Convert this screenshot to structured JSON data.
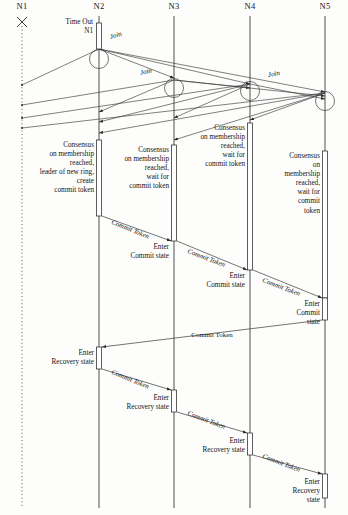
{
  "diagram": {
    "type": "uml-sequence-diagram",
    "width": 348,
    "height": 515,
    "background": "#fdfdfc",
    "line_color": "#333333",
    "text_color": "#141414"
  },
  "nodes": [
    {
      "id": "N1",
      "label": "N1",
      "x": 22,
      "crashed": true,
      "lifeline_style": "dotted"
    },
    {
      "id": "N2",
      "label": "N2",
      "x": 99,
      "crashed": false,
      "lifeline_style": "solid"
    },
    {
      "id": "N3",
      "label": "N3",
      "x": 174,
      "crashed": false,
      "lifeline_style": "solid"
    },
    {
      "id": "N4",
      "label": "N4",
      "x": 250,
      "crashed": false,
      "lifeline_style": "solid"
    },
    {
      "id": "N5",
      "label": "N5",
      "x": 325,
      "crashed": false,
      "lifeline_style": "solid"
    }
  ],
  "timeout": {
    "label": "Time Out\nN1",
    "on_node": "N2",
    "x": 93,
    "y": 18
  },
  "join_labels": [
    {
      "text": "Join",
      "x": 110,
      "y": 33,
      "rotate": -16
    },
    {
      "text": "Join",
      "x": 140,
      "y": 69,
      "rotate": -12
    },
    {
      "text": "Join",
      "x": 268,
      "y": 71,
      "rotate": -10
    }
  ],
  "consensus_blocks": [
    {
      "node": "N2",
      "align": "right",
      "x": 94,
      "y": 141,
      "text": "Consensus\non membership\nreached,\nleader of new ring,\ncreate\ncommit token"
    },
    {
      "node": "N3",
      "align": "right",
      "x": 169,
      "y": 146,
      "text": "Consensus\non membership\nreached,\nwait for\ncommit token"
    },
    {
      "node": "N4",
      "align": "right",
      "x": 245,
      "y": 124,
      "text": "Consensus\non membership\nreached,\nwait for\ncommit token"
    },
    {
      "node": "N5",
      "align": "right",
      "x": 320,
      "y": 152,
      "text": "Consensus\non membership\nreached,\nwait for\ncommit token"
    }
  ],
  "commit_state_labels": [
    {
      "node": "N3",
      "x": 169,
      "y": 243,
      "text": "Enter\nCommit state"
    },
    {
      "node": "N4",
      "x": 245,
      "y": 272,
      "text": "Enter\nCommit state"
    },
    {
      "node": "N5",
      "x": 320,
      "y": 300,
      "text": "Enter\nCommit state"
    }
  ],
  "recovery_state_labels": [
    {
      "node": "N2",
      "x": 94,
      "y": 349,
      "text": "Enter\nRecovery state"
    },
    {
      "node": "N3",
      "x": 169,
      "y": 394,
      "text": "Enter\nRecovery state"
    },
    {
      "node": "N4",
      "x": 245,
      "y": 437,
      "text": "Enter\nRecovery state"
    },
    {
      "node": "N5",
      "x": 320,
      "y": 478,
      "text": "Enter\nRecovery state"
    }
  ],
  "commit_token_messages": [
    {
      "from": "N2",
      "to": "N3",
      "label": "Commit Token",
      "x": 112,
      "y": 218,
      "rotate": 22,
      "italic": true
    },
    {
      "from": "N3",
      "to": "N4",
      "label": "Commit Token",
      "x": 188,
      "y": 247,
      "rotate": 21,
      "italic": true
    },
    {
      "from": "N4",
      "to": "N5",
      "label": "Commit Token",
      "x": 263,
      "y": 276,
      "rotate": 21,
      "italic": true
    },
    {
      "from": "N5",
      "to": "N2",
      "label": "Commit Token",
      "x": 212,
      "y": 331,
      "rotate": 0,
      "italic": false
    },
    {
      "from": "N2",
      "to": "N3",
      "label": "Commit Token",
      "x": 112,
      "y": 368,
      "rotate": 22,
      "italic": true
    },
    {
      "from": "N3",
      "to": "N4",
      "label": "Commit Token",
      "x": 188,
      "y": 409,
      "rotate": 21,
      "italic": true
    },
    {
      "from": "N4",
      "to": "N5",
      "label": "Commit Token",
      "x": 263,
      "y": 452,
      "rotate": 21,
      "italic": true
    }
  ],
  "activations": [
    {
      "node": "N2",
      "x": 99,
      "y": 23,
      "h": 26
    },
    {
      "node": "N2",
      "x": 99,
      "y": 140,
      "h": 76
    },
    {
      "node": "N3",
      "x": 174,
      "y": 145,
      "h": 96
    },
    {
      "node": "N4",
      "x": 250,
      "y": 123,
      "h": 147
    },
    {
      "node": "N5",
      "x": 325,
      "y": 151,
      "h": 147
    },
    {
      "node": "N5",
      "x": 325,
      "y": 298,
      "h": 22
    },
    {
      "node": "N2",
      "x": 99,
      "y": 347,
      "h": 22
    },
    {
      "node": "N3",
      "x": 174,
      "y": 390,
      "h": 22
    },
    {
      "node": "N4",
      "x": 250,
      "y": 433,
      "h": 22
    },
    {
      "node": "N5",
      "x": 325,
      "y": 474,
      "h": 24
    }
  ],
  "join_loops": [
    {
      "node": "N2",
      "cx": 99,
      "cy": 59
    },
    {
      "node": "N3",
      "cx": 174,
      "cy": 88
    },
    {
      "node": "N4",
      "cx": 250,
      "cy": 91
    },
    {
      "node": "N5",
      "cx": 325,
      "cy": 101
    }
  ]
}
